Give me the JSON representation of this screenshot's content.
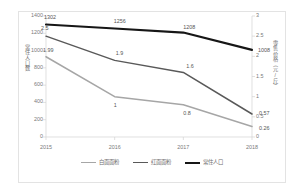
{
  "chart_data": {
    "type": "line",
    "title": "",
    "xlabel": "",
    "categories": [
      "2015",
      "2016",
      "2017",
      "2018"
    ],
    "grid": false,
    "legend_position": "bottom",
    "axes": {
      "left": {
        "label": "常住人口数",
        "ylim": [
          0,
          1400
        ],
        "ticks": [
          "1400",
          "1200",
          "1000",
          "800",
          "600",
          "400",
          "200",
          "0"
        ],
        "tick_values": [
          1400,
          1200,
          1000,
          800,
          600,
          400,
          200,
          0
        ]
      },
      "right": {
        "label": "零售价格（元/斤）",
        "ylim": [
          0,
          3
        ],
        "ticks": [
          "3",
          "2.5",
          "2",
          "1.5",
          "1",
          "0.5",
          "0"
        ],
        "tick_values": [
          3,
          2.5,
          2,
          1.5,
          1,
          0.5,
          0
        ]
      }
    },
    "series": [
      {
        "name": "白面面粉",
        "axis": "right",
        "color": "#a6a6a6",
        "values": [
          1.99,
          1,
          0.8,
          0.26
        ],
        "labels": [
          "1.99",
          "1",
          "0.8",
          "0.26"
        ]
      },
      {
        "name": "红面面粉",
        "axis": "right",
        "color": "#595959",
        "values": [
          2.5,
          1.9,
          1.6,
          0.57
        ],
        "labels": [
          "2.5",
          "1.9",
          "1.6",
          "0.57"
        ]
      },
      {
        "name": "常住人口",
        "axis": "left",
        "color": "#161616",
        "values": [
          1302,
          1256,
          1208,
          1008
        ],
        "labels": [
          "1302",
          "1256",
          "1208",
          "1008"
        ]
      }
    ]
  }
}
